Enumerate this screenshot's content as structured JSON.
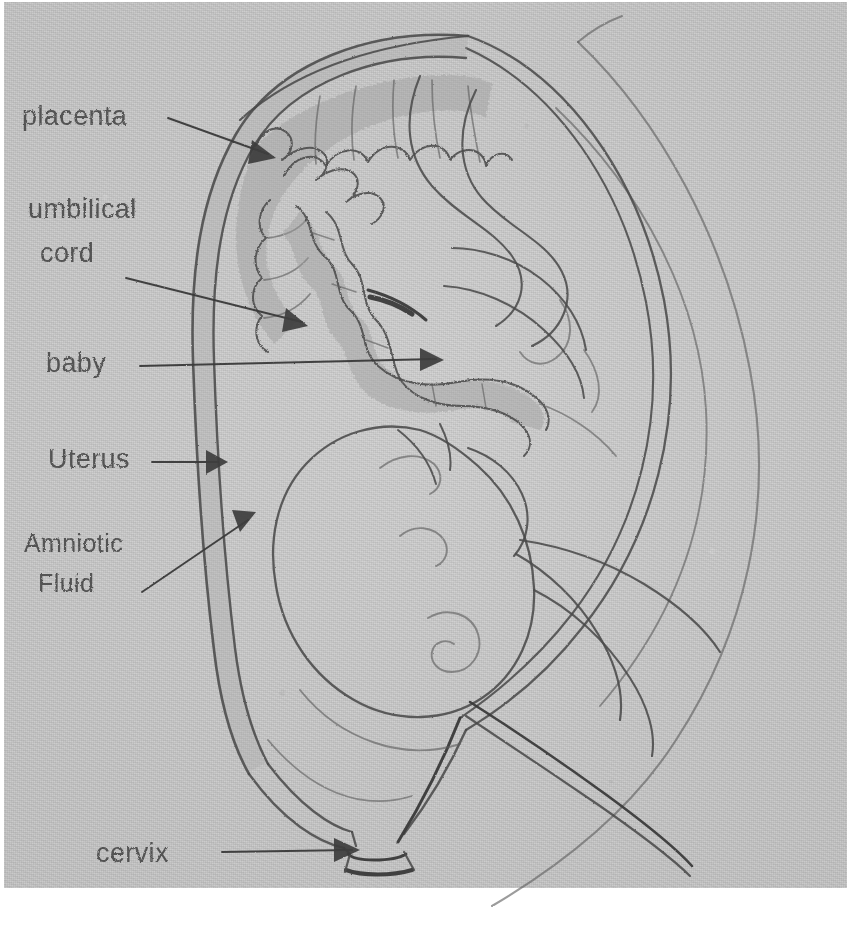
{
  "document": {
    "kind": "hand-drawn-pencil-diagram",
    "subject": "Cross-section of a pregnant uterus with fetus",
    "medium": "pencil on grey paper",
    "paper_color": "#c6c6c6",
    "pencil_color": "#4b4b4b",
    "shading_color": "#9e9e9e"
  },
  "labels": [
    {
      "id": "placenta",
      "text": "placenta",
      "x": 22,
      "y": 125,
      "arrow_tip_x": 272,
      "arrow_tip_y": 156
    },
    {
      "id": "umbilical-cord",
      "text": "umbilical",
      "x": 28,
      "y": 218,
      "arrow_tip_x": 306,
      "arrow_tip_y": 324
    },
    {
      "id": "umbilical-cord2",
      "text": "cord",
      "x": 40,
      "y": 262,
      "arrow_tip_x": 306,
      "arrow_tip_y": 324
    },
    {
      "id": "baby",
      "text": "baby",
      "x": 46,
      "y": 372,
      "arrow_tip_x": 441,
      "arrow_tip_y": 360
    },
    {
      "id": "uterus",
      "text": "Uterus",
      "x": 48,
      "y": 468,
      "arrow_tip_x": 224,
      "arrow_tip_y": 462
    },
    {
      "id": "amniotic-fluid",
      "text": "Amniotic",
      "x": 24,
      "y": 552,
      "arrow_tip_x": 252,
      "arrow_tip_y": 516
    },
    {
      "id": "amniotic-fluid2",
      "text": "Fluid",
      "x": 38,
      "y": 592,
      "arrow_tip_x": 252,
      "arrow_tip_y": 516
    },
    {
      "id": "cervix",
      "text": "cervix",
      "x": 96,
      "y": 862,
      "arrow_tip_x": 358,
      "arrow_tip_y": 850
    }
  ],
  "anatomy_parts": [
    {
      "name": "placenta",
      "description": "lobed shaded mass attached to upper-left inner uterine wall"
    },
    {
      "name": "umbilical cord",
      "description": "wavy shaded tube running from placenta to the fetus navel"
    },
    {
      "name": "baby",
      "description": "fetus in head-down vertex position with face, ear and arm visible"
    },
    {
      "name": "uterus",
      "description": "thick double-walled oval sac enclosing the fetus"
    },
    {
      "name": "amniotic fluid",
      "description": "clear space between the uterine wall and the fetus"
    },
    {
      "name": "cervix",
      "description": "narrow funnel-shaped opening at the bottom of the uterus"
    }
  ]
}
